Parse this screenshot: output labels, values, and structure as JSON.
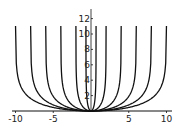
{
  "chart_data": {
    "type": "line",
    "title": "",
    "xlabel": "",
    "ylabel": "",
    "xlim": [
      -10.0,
      10.0
    ],
    "ylim": [
      0,
      13
    ],
    "grid": false,
    "x_ticks": [
      -10,
      -5,
      5,
      10
    ],
    "x_tick_labels": [
      "-10",
      "-5",
      "5",
      "10"
    ],
    "y_ticks": [
      2,
      4,
      6,
      8,
      10,
      12
    ],
    "y_tick_labels": [
      "2",
      "4",
      "6",
      "8",
      "10",
      "12"
    ],
    "series_description": "Family of U-shaped curves, each with vertical asymptotes at x = ±a, minimum 0 at x = 0",
    "asymptotes": [
      0.67,
      2,
      4,
      6,
      8,
      10
    ],
    "series": [
      {
        "name": "a=0.67",
        "asymptote": 0.67
      },
      {
        "name": "a=2",
        "asymptote": 2
      },
      {
        "name": "a=4",
        "asymptote": 4
      },
      {
        "name": "a=6",
        "asymptote": 6
      },
      {
        "name": "a=8",
        "asymptote": 8
      },
      {
        "name": "a=10",
        "asymptote": 10
      }
    ]
  }
}
